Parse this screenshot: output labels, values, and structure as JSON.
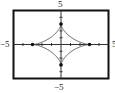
{
  "chart_data": {
    "type": "line",
    "title": "",
    "xlabel": "",
    "ylabel": "",
    "xlim": [
      -5,
      5
    ],
    "ylim": [
      -5,
      5
    ],
    "xscale": 1,
    "yscale": 1,
    "grid": false,
    "tick_labels": {
      "x_min": "-5",
      "x_max": "5",
      "y_min": "-5",
      "y_max": "5"
    },
    "series": [
      {
        "name": "astroid",
        "parametric": "x=3cos^3 t, y=3sin^3 t",
        "cusps": [
          [
            3,
            0
          ],
          [
            0,
            3
          ],
          [
            -3,
            0
          ],
          [
            0,
            -3
          ]
        ],
        "marked_points": [
          [
            3,
            0
          ],
          [
            0,
            3
          ],
          [
            -3,
            0
          ],
          [
            0,
            -3
          ]
        ]
      }
    ]
  },
  "labels": {
    "top": "5",
    "bottom": "−5",
    "left": "−5",
    "right": "5"
  },
  "colors": {
    "frame": "#111111",
    "curve": "#555555",
    "axis": "#333333"
  }
}
